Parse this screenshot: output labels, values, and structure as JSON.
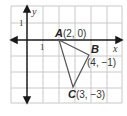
{
  "diagram": {
    "type": "coordinate-plane-triangle",
    "axes": {
      "x_label": "x",
      "y_label": "y",
      "x_tick": "1",
      "y_tick": "1"
    },
    "points": [
      {
        "name": "A",
        "coords": "(2, 0)",
        "x": 2,
        "y": 0
      },
      {
        "name": "B",
        "coords": "(4, −1)",
        "x": 4,
        "y": -1
      },
      {
        "name": "C",
        "coords": "(3, −3)",
        "x": 3,
        "y": -3
      }
    ],
    "grid": {
      "x_range": [
        -1,
        6
      ],
      "y_range": [
        -4,
        2
      ],
      "cell_px": 16
    },
    "colors": {
      "grid": "#c8c8c8",
      "axis": "#1a1a1a",
      "triangle": "#555555",
      "background": "#ffffff"
    }
  }
}
